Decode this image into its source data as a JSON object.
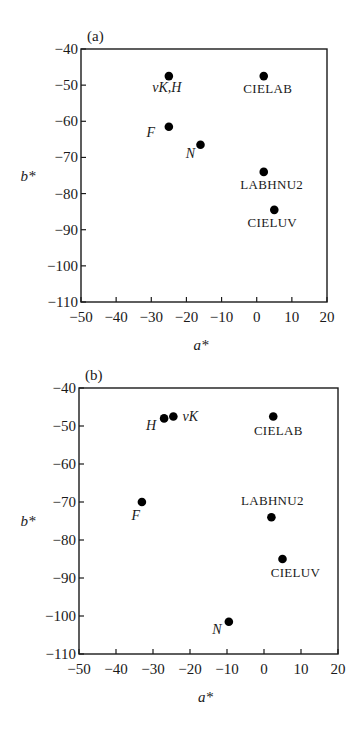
{
  "chart_data": [
    {
      "type": "scatter",
      "panel": "(a)",
      "title": "",
      "xlabel": "a*",
      "ylabel": "b*",
      "xlim": [
        -50,
        20
      ],
      "ylim": [
        -110,
        -40
      ],
      "xticks": [
        -50,
        -40,
        -30,
        -20,
        -10,
        0,
        10,
        20
      ],
      "yticks": [
        -40,
        -50,
        -60,
        -70,
        -80,
        -90,
        -100,
        -110
      ],
      "grid": false,
      "legend": null,
      "points": [
        {
          "label": "vK,H",
          "x": -25,
          "y": -47.5,
          "italic": true,
          "label_dx": -2,
          "label_dy": 16,
          "anchor": "middle"
        },
        {
          "label": "CIELAB",
          "x": 2,
          "y": -47.5,
          "italic": false,
          "label_dx": 4,
          "label_dy": 17,
          "anchor": "middle"
        },
        {
          "label": "F",
          "x": -25,
          "y": -61.5,
          "italic": true,
          "label_dx": -18,
          "label_dy": 10,
          "anchor": "middle"
        },
        {
          "label": "N",
          "x": -16,
          "y": -66.5,
          "italic": true,
          "label_dx": -10,
          "label_dy": 13,
          "anchor": "middle"
        },
        {
          "label": "LABHNU2",
          "x": 2,
          "y": -74,
          "italic": false,
          "label_dx": 8,
          "label_dy": 17,
          "anchor": "middle"
        },
        {
          "label": "CIELUV",
          "x": 5,
          "y": -84.5,
          "italic": false,
          "label_dx": -2,
          "label_dy": 17,
          "anchor": "middle"
        }
      ]
    },
    {
      "type": "scatter",
      "panel": "(b)",
      "title": "",
      "xlabel": "a*",
      "ylabel": "b*",
      "xlim": [
        -50,
        20
      ],
      "ylim": [
        -110,
        -40
      ],
      "xticks": [
        -50,
        -40,
        -30,
        -20,
        -10,
        0,
        10,
        20
      ],
      "yticks": [
        -40,
        -50,
        -60,
        -70,
        -80,
        -90,
        -100,
        -110
      ],
      "grid": false,
      "legend": null,
      "points": [
        {
          "label": "H",
          "x": -27,
          "y": -48,
          "italic": true,
          "label_dx": -13,
          "label_dy": 12,
          "anchor": "middle"
        },
        {
          "label": "vK",
          "x": -24.5,
          "y": -47.5,
          "italic": true,
          "label_dx": 17,
          "label_dy": 4,
          "anchor": "middle"
        },
        {
          "label": "CIELAB",
          "x": 2.5,
          "y": -47.5,
          "italic": false,
          "label_dx": 5,
          "label_dy": 18,
          "anchor": "middle"
        },
        {
          "label": "F",
          "x": -33,
          "y": -70,
          "italic": true,
          "label_dx": -6,
          "label_dy": 18,
          "anchor": "middle"
        },
        {
          "label": "LABHNU2",
          "x": 2,
          "y": -74,
          "italic": false,
          "label_dx": 1,
          "label_dy": -12,
          "anchor": "middle"
        },
        {
          "label": "CIELUV",
          "x": 5,
          "y": -85,
          "italic": false,
          "label_dx": 13,
          "label_dy": 18,
          "anchor": "middle"
        },
        {
          "label": "N",
          "x": -9.5,
          "y": -101.5,
          "italic": true,
          "label_dx": -12,
          "label_dy": 12,
          "anchor": "middle"
        }
      ]
    }
  ],
  "figures": {
    "a": {
      "panel_label": "(a)",
      "xlabel": "a*",
      "ylabel": "b*"
    },
    "b": {
      "panel_label": "(b)",
      "xlabel": "a*",
      "ylabel": "b*"
    }
  },
  "layout": {
    "a": {
      "left": 81,
      "right": 327,
      "top": 49,
      "bottom": 302
    },
    "b": {
      "left": 79,
      "right": 338,
      "top": 28,
      "bottom": 294
    }
  },
  "colors": {
    "axis": "#1a1a1a",
    "point": "#000000",
    "text": "#1a1a1a"
  }
}
